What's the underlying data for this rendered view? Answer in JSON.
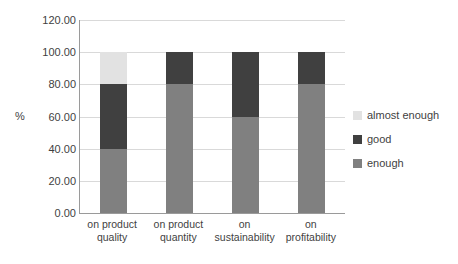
{
  "chart_data": {
    "type": "bar",
    "stacked": true,
    "title": "",
    "xlabel": "",
    "ylabel": "%",
    "ylim": [
      0,
      120
    ],
    "ytick_step": 20,
    "ytick_labels": [
      "0.00",
      "20.00",
      "40.00",
      "60.00",
      "80.00",
      "100.00",
      "120.00"
    ],
    "ytick_values": [
      0,
      20,
      40,
      60,
      80,
      100,
      120
    ],
    "grid": true,
    "legend_position": "right",
    "categories": [
      "on product quality",
      "on product quantity",
      "on sustainability",
      "on profitability"
    ],
    "category_lines": [
      [
        "on product",
        "quality"
      ],
      [
        "on product",
        "quantity"
      ],
      [
        "on",
        "sustainability"
      ],
      [
        "on",
        "profitability"
      ]
    ],
    "series": [
      {
        "name": "enough",
        "color": "#808080",
        "values": [
          40,
          80,
          60,
          80
        ]
      },
      {
        "name": "good",
        "color": "#404040",
        "values": [
          40,
          20,
          40,
          20
        ]
      },
      {
        "name": "almost enough",
        "color": "#e2e2e2",
        "values": [
          20,
          0,
          0,
          0
        ]
      }
    ],
    "legend_order": [
      "almost enough",
      "good",
      "enough"
    ],
    "colors": {
      "almost_enough": "#e2e2e2",
      "good": "#404040",
      "enough": "#808080",
      "gridline": "#d9d9d9",
      "axis": "#9a9a9a",
      "text": "#3f3f3f",
      "background": "#ffffff"
    }
  }
}
